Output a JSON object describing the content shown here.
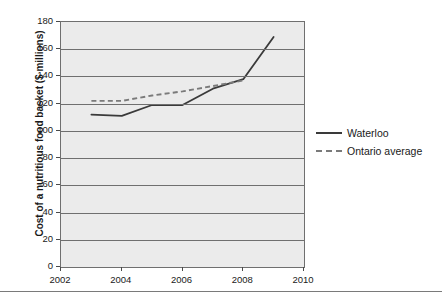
{
  "chart_data": {
    "type": "line",
    "title": "",
    "xlabel": "",
    "ylabel": "Cost of a nutritious food basket ($ millions)",
    "xlim": [
      2002,
      2010
    ],
    "ylim": [
      0,
      180
    ],
    "xticks": [
      "2002",
      "2004",
      "2006",
      "2008",
      "2010"
    ],
    "yticks": [
      "0",
      "20",
      "40",
      "60",
      "80",
      "100",
      "120",
      "140",
      "160",
      "180"
    ],
    "grid": "horizontal",
    "legend_position": "right",
    "series": [
      {
        "name": "Waterloo",
        "style": "solid",
        "color": "#3a3a3a",
        "x": [
          2003,
          2004,
          2005,
          2006,
          2007,
          2008,
          2009
        ],
        "values": [
          112,
          111,
          119,
          119,
          131,
          138,
          169
        ]
      },
      {
        "name": "Ontario average",
        "style": "dashed",
        "color": "#7a7a7a",
        "x": [
          2003,
          2004,
          2005,
          2006,
          2007,
          2008
        ],
        "values": [
          122,
          122,
          126,
          129,
          133,
          137
        ]
      }
    ]
  },
  "axes": {
    "y_label": "Cost of a nutritious food basket ($ millions)",
    "y_ticks": [
      "180",
      "160",
      "140",
      "120",
      "100",
      "80",
      "60",
      "40",
      "20",
      "0"
    ],
    "x_ticks": [
      "2002",
      "2004",
      "2006",
      "2008",
      "2010"
    ]
  },
  "legend": {
    "items": [
      {
        "label": "Waterloo",
        "style": "solid"
      },
      {
        "label": "Ontario average",
        "style": "dashed"
      }
    ]
  }
}
